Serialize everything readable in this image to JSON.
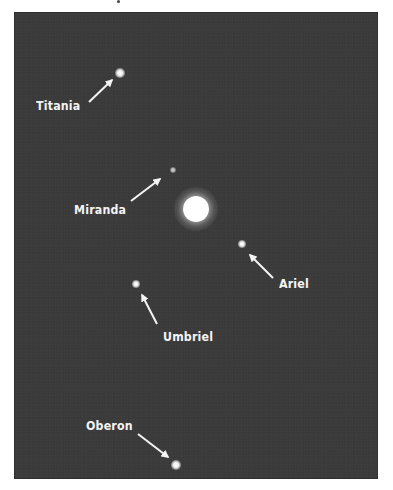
{
  "figure": {
    "background_color": "#3b3b3b",
    "label_color": "#f4f4f4",
    "planet": {
      "name": "",
      "x": 196,
      "y": 209,
      "radius": 13,
      "glow_radius": 22
    },
    "moons": [
      {
        "name": "Titania",
        "dot": {
          "x": 120,
          "y": 73,
          "r": 4
        },
        "label": {
          "x": 36,
          "y": 99
        },
        "arrow": {
          "x1": 89,
          "y1": 102,
          "x2": 112,
          "y2": 80
        }
      },
      {
        "name": "Miranda",
        "dot": {
          "x": 173,
          "y": 170,
          "r": 2.5
        },
        "label": {
          "x": 74,
          "y": 203
        },
        "arrow": {
          "x1": 131,
          "y1": 201,
          "x2": 160,
          "y2": 179
        }
      },
      {
        "name": "Ariel",
        "dot": {
          "x": 242,
          "y": 244,
          "r": 3.5
        },
        "label": {
          "x": 279,
          "y": 277
        },
        "arrow": {
          "x1": 273,
          "y1": 278,
          "x2": 250,
          "y2": 255
        }
      },
      {
        "name": "Umbriel",
        "dot": {
          "x": 136,
          "y": 284,
          "r": 3.5
        },
        "label": {
          "x": 163,
          "y": 330
        },
        "arrow": {
          "x1": 157,
          "y1": 324,
          "x2": 142,
          "y2": 295
        }
      },
      {
        "name": "Oberon",
        "dot": {
          "x": 176,
          "y": 465,
          "r": 4
        },
        "label": {
          "x": 86,
          "y": 419
        },
        "arrow": {
          "x1": 138,
          "y1": 434,
          "x2": 168,
          "y2": 457
        }
      }
    ]
  }
}
